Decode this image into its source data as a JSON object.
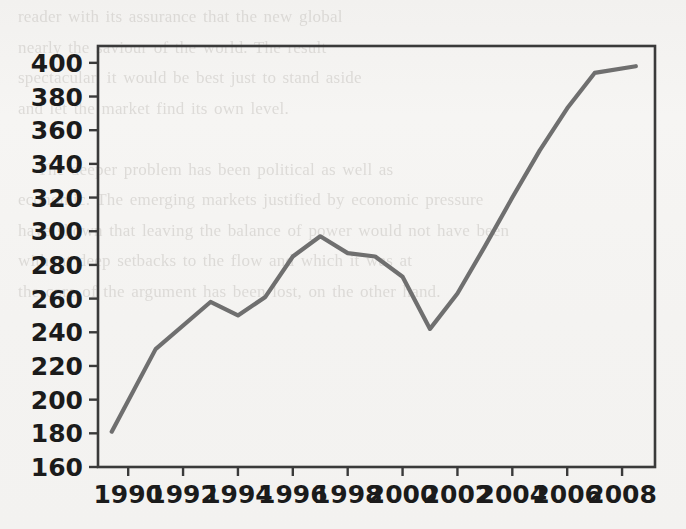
{
  "page": {
    "background_color": "#f4f3f1",
    "ghost_text": "reader with its assurance that the new global\nnearly the saviour of the world. The result\nspectacular, it would be best just to stand aside\nand let the market find its own level.\n\n   The deeper problem has been political as well as\neconomic. The emerging markets justified by economic pressure\nhave shown that leaving the balance of power would not have been\nwithout deep setbacks to the flow and which it was at\nthe core of the argument has been lost, on the other hand."
  },
  "chart_data": {
    "type": "line",
    "title": "",
    "xlabel": "",
    "ylabel": "",
    "xlim": [
      1988.9,
      2009.2
    ],
    "ylim": [
      160,
      410
    ],
    "ytick_step": 20,
    "grid": false,
    "legend": false,
    "line_color": "#6f6f6f",
    "axis_color": "#3a3a3a",
    "xticks": [
      1990,
      1992,
      1994,
      1996,
      1998,
      2000,
      2002,
      2004,
      2006,
      2008
    ],
    "xtick_labels": [
      "1990",
      "1992",
      "1994",
      "1996",
      "1998",
      "2000",
      "2002",
      "2004",
      "2006",
      "2008"
    ],
    "yticks": [
      160,
      180,
      200,
      220,
      240,
      260,
      280,
      300,
      320,
      340,
      360,
      380,
      400
    ],
    "ytick_labels": [
      "160",
      "180",
      "200",
      "220",
      "240",
      "260",
      "280",
      "300",
      "320",
      "340",
      "360",
      "380",
      "400"
    ],
    "x": [
      1989.4,
      1991,
      1993,
      1994,
      1995,
      1996,
      1997,
      1998,
      1999,
      2000,
      2001,
      2002,
      2003,
      2004,
      2005,
      2006,
      2007,
      2008.5
    ],
    "values": [
      181,
      230,
      258,
      250,
      261,
      285,
      297,
      287,
      285,
      273,
      242,
      263,
      291,
      320,
      348,
      373,
      394,
      398
    ],
    "series": [
      {
        "name": "series-1",
        "x": [
          1989.4,
          1991,
          1993,
          1994,
          1995,
          1996,
          1997,
          1998,
          1999,
          2000,
          2001,
          2002,
          2003,
          2004,
          2005,
          2006,
          2007,
          2008.5
        ],
        "values": [
          181,
          230,
          258,
          250,
          261,
          285,
          297,
          287,
          285,
          273,
          242,
          263,
          291,
          320,
          348,
          373,
          394,
          398
        ]
      }
    ]
  }
}
